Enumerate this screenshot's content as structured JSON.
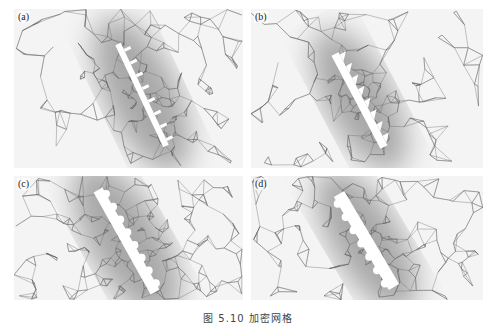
{
  "figure": {
    "caption": "图 5.10  加密网格",
    "panels": [
      {
        "id": "a",
        "label": "(a)",
        "x": 14,
        "y": 9,
        "w": 229,
        "h": 159,
        "structure": {
          "type": "comb-square",
          "x1": 104,
          "y1": 35,
          "x2": 152,
          "y2": 137,
          "teeth": 8,
          "width": 6
        }
      },
      {
        "id": "b",
        "label": "(b)",
        "x": 251,
        "y": 9,
        "w": 232,
        "h": 159,
        "structure": {
          "type": "comb-triangle",
          "x1": 84,
          "y1": 45,
          "x2": 133,
          "y2": 138,
          "teeth": 8,
          "width": 8
        }
      },
      {
        "id": "c",
        "label": "(c)",
        "x": 14,
        "y": 176,
        "w": 229,
        "h": 124,
        "structure": {
          "type": "bar-semicircle",
          "x1": 84,
          "y1": 14,
          "x2": 141,
          "y2": 116,
          "teeth": 8,
          "width": 10
        }
      },
      {
        "id": "d",
        "label": "(d)",
        "x": 251,
        "y": 176,
        "w": 232,
        "h": 124,
        "structure": {
          "type": "bar-semicircle-outer",
          "x1": 88,
          "y1": 18,
          "x2": 143,
          "y2": 111,
          "teeth": 7,
          "width": 12
        }
      }
    ]
  },
  "style": {
    "mesh_color": "#5a5a5a",
    "background": "#ffffff",
    "structure_fill": "#ffffff"
  }
}
